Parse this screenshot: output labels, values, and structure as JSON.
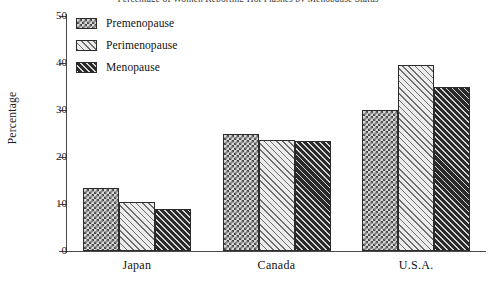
{
  "chart_data": {
    "type": "bar",
    "title": "Percentage of Women Reporting Hot Flashes by Menopause Status",
    "xlabel": "",
    "ylabel": "Percentage",
    "categories": [
      "Japan",
      "Canada",
      "U.S.A."
    ],
    "series": [
      {
        "name": "Premenopause",
        "values": [
          13.4,
          25.0,
          30.0
        ],
        "pattern": "cross-hatch",
        "color": "#d8d8d8"
      },
      {
        "name": "Perimenopause",
        "values": [
          10.4,
          23.7,
          39.5
        ],
        "pattern": "light-diagonal-hatch",
        "color": "#ececec"
      },
      {
        "name": "Menopause",
        "values": [
          8.9,
          23.4,
          35.0
        ],
        "pattern": "dark-diagonal-hatch",
        "color": "#2a2a2a"
      }
    ],
    "ylim": [
      0,
      50
    ],
    "yticks": [
      0,
      10,
      20,
      30,
      40,
      50
    ],
    "ytick_labels": [
      "0",
      "10",
      "20",
      "30",
      "40",
      "50"
    ],
    "grid": false,
    "legend_position": "upper-left-inside"
  },
  "axis": {
    "y_label": "Percentage",
    "y_ticks": [
      "50",
      "40",
      "30",
      "20",
      "10",
      "0"
    ],
    "x_ticks": [
      "Japan",
      "Canada",
      "U.S.A."
    ]
  },
  "legend": {
    "items": [
      {
        "label": "Premenopause"
      },
      {
        "label": "Perimenopause"
      },
      {
        "label": "Menopause"
      }
    ]
  }
}
